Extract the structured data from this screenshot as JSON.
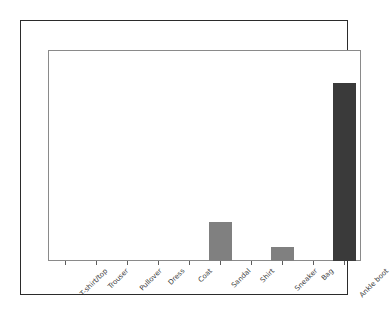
{
  "chart_data": {
    "type": "bar",
    "title": "",
    "subtitle": "",
    "xlabel": "",
    "ylabel": "",
    "categories": [
      "T-shirt/top",
      "Trouser",
      "Pullover",
      "Dress",
      "Coat",
      "Sandal",
      "Shirt",
      "Sneaker",
      "Bag",
      "Ankle boot"
    ],
    "values": [
      0,
      0,
      0,
      0,
      0,
      0.22,
      0,
      0.08,
      0,
      1.0
    ],
    "ylim": [
      0,
      1.18
    ],
    "grid": false,
    "legend": null,
    "legend_position": "none",
    "y_tick_labels": [],
    "x_tick_labels": [
      "T-shirt/top",
      "Trouser",
      "Pullover",
      "Dress",
      "Coat",
      "Sandal",
      "Shirt",
      "Sneaker",
      "Bag",
      "Ankle boot"
    ],
    "x_tick_label_rotation": "-45",
    "annotations": [],
    "bar_colors": [
      "#808080",
      "#808080",
      "#808080",
      "#808080",
      "#808080",
      "#808080",
      "#808080",
      "#808080",
      "#808080",
      "#3a3a3a"
    ],
    "highlighted_category": "Ankle boot",
    "bars": [
      {
        "category": "T-shirt/top",
        "value": 0,
        "color": "#808080"
      },
      {
        "category": "Trouser",
        "value": 0,
        "color": "#808080"
      },
      {
        "category": "Pullover",
        "value": 0,
        "color": "#808080"
      },
      {
        "category": "Dress",
        "value": 0,
        "color": "#808080"
      },
      {
        "category": "Coat",
        "value": 0,
        "color": "#808080"
      },
      {
        "category": "Sandal",
        "value": 0.22,
        "color": "#808080"
      },
      {
        "category": "Shirt",
        "value": 0,
        "color": "#808080"
      },
      {
        "category": "Sneaker",
        "value": 0.08,
        "color": "#808080"
      },
      {
        "category": "Bag",
        "value": 0,
        "color": "#808080"
      },
      {
        "category": "Ankle boot",
        "value": 1.0,
        "color": "#3a3a3a"
      }
    ]
  },
  "style": {
    "figure_border_color": "#2b2b2b",
    "axes_spine_color": "#8a8a8a",
    "background": "#ffffff",
    "tick_color": "#5d5d5d",
    "label_color": "#3a3a3a"
  }
}
